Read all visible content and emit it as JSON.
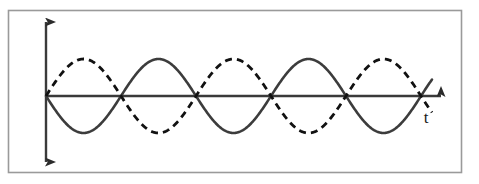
{
  "figure": {
    "canvas": {
      "width": 479,
      "height": 184,
      "background": "#ffffff"
    },
    "frame": {
      "name": "figure-border",
      "x": 8.5,
      "y": 10.5,
      "width": 453,
      "height": 162,
      "stroke": "#9a9a9a",
      "stroke_width": 1.6,
      "fill": "#ffffff"
    },
    "axes": {
      "origin": {
        "x": 46,
        "y": 96
      },
      "vertical": {
        "label": "",
        "x": 46,
        "y_top": 22,
        "y_bottom": 162,
        "arrow": "double",
        "stroke": "#3a3a3a",
        "stroke_width": 2.4
      },
      "horizontal": {
        "label": "t",
        "label_x": 426,
        "label_y": 123,
        "y": 96,
        "x_start": 46,
        "x_end": 441,
        "arrow": "single-right",
        "stroke": "#3a3a3a",
        "stroke_width": 2.4
      }
    },
    "colors": {
      "solid_curve": "#3c3c3c",
      "dashed_curve": "#111111",
      "axis": "#3a3a3a",
      "border": "#9a9a9a",
      "background": "#ffffff"
    }
  },
  "chart_data": {
    "type": "line",
    "title": "",
    "xlabel": "t",
    "ylabel": "",
    "grid": false,
    "legend": "none",
    "xlim": [
      0,
      2.58
    ],
    "ylim": [
      -1.25,
      1.25
    ],
    "x_unit": "periods",
    "annotations": [
      {
        "text": "t",
        "x": 426,
        "y": 123,
        "name": "time-axis-label"
      }
    ],
    "series": [
      {
        "name": "wave-solid",
        "style": "solid",
        "color": "#3c3c3c",
        "stroke_width": 2.6,
        "amplitude": 1.0,
        "period_px": 150,
        "phase_deg": 180,
        "formula": "y = -A*sin(2*pi*t/T)",
        "x_start_px": 46,
        "x_end_px": 432,
        "amplitude_px": 37,
        "zero_crossings_px": [
          46,
          121,
          196,
          271,
          346,
          421
        ],
        "values": [
          0,
          -1,
          0,
          1,
          0,
          -1,
          0,
          1,
          0,
          -1,
          0,
          1,
          0
        ]
      },
      {
        "name": "wave-dashed",
        "style": "dashed",
        "color": "#111111",
        "stroke_width": 2.8,
        "dash_pattern": "7 5",
        "amplitude": 1.0,
        "period_px": 150,
        "phase_deg": 0,
        "formula": "y = A*sin(2*pi*t/T)",
        "x_start_px": 46,
        "x_end_px": 432,
        "amplitude_px": 37,
        "zero_crossings_px": [
          46,
          121,
          196,
          271,
          346,
          421
        ],
        "values": [
          0,
          1,
          0,
          -1,
          0,
          1,
          0,
          -1,
          0,
          1,
          0,
          -1,
          0
        ]
      }
    ],
    "phase_difference_deg": 180,
    "cycles_shown": 2.57
  }
}
